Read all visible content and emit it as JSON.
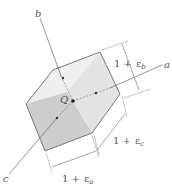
{
  "figure": {
    "axes": {
      "a": "a",
      "b": "b",
      "c": "c"
    },
    "point_label": "Q",
    "dimensions": {
      "b": {
        "one": "1 +",
        "eps": "ε",
        "sub": "b"
      },
      "c": {
        "one": "1 +",
        "eps": "ε",
        "sub": "c"
      },
      "a": {
        "one": "1 +",
        "eps": "ε",
        "sub": "a"
      }
    },
    "colors": {
      "top_face": "#efefef",
      "right_face": "#e2e2e2",
      "left_face": "#cfcfcf",
      "edge": "#6a6a6a",
      "axis": "#555555"
    }
  }
}
